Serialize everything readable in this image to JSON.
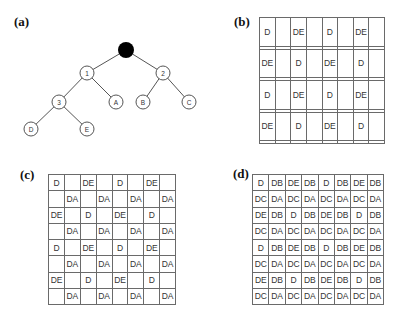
{
  "panels": {
    "a": {
      "label": "(a)",
      "tree": {
        "root": {
          "id": "root",
          "label": "",
          "filled": true,
          "x": 126,
          "y": 50,
          "r": 8
        },
        "nodes": [
          {
            "id": "n1",
            "label": "1",
            "x": 87,
            "y": 73
          },
          {
            "id": "n2",
            "label": "2",
            "x": 163,
            "y": 73
          },
          {
            "id": "n3",
            "label": "3",
            "x": 59,
            "y": 102
          },
          {
            "id": "nA",
            "label": "A",
            "x": 116,
            "y": 102
          },
          {
            "id": "nB",
            "label": "B",
            "x": 143,
            "y": 102
          },
          {
            "id": "nC",
            "label": "C",
            "x": 189,
            "y": 102
          },
          {
            "id": "nD",
            "label": "D",
            "x": 31,
            "y": 129
          },
          {
            "id": "nE",
            "label": "E",
            "x": 87,
            "y": 129
          }
        ],
        "edges": [
          [
            "root",
            "n1"
          ],
          [
            "root",
            "n2"
          ],
          [
            "n1",
            "n3"
          ],
          [
            "n1",
            "nA"
          ],
          [
            "n2",
            "nB"
          ],
          [
            "n2",
            "nC"
          ],
          [
            "n3",
            "nD"
          ],
          [
            "n3",
            "nE"
          ]
        ]
      }
    },
    "b": {
      "label": "(b)",
      "rows": [
        [
          "D",
          "",
          "DE",
          "",
          "D",
          "",
          "DE",
          ""
        ],
        [
          "",
          "",
          "",
          "",
          "",
          "",
          "",
          ""
        ],
        [
          "DE",
          "",
          "D",
          "",
          "DE",
          "",
          "D",
          ""
        ],
        [
          "",
          "",
          "",
          "",
          "",
          "",
          "",
          ""
        ],
        [
          "D",
          "",
          "DE",
          "",
          "D",
          "",
          "DE",
          ""
        ],
        [
          "",
          "",
          "",
          "",
          "",
          "",
          "",
          ""
        ],
        [
          "DE",
          "",
          "D",
          "",
          "DE",
          "",
          "D",
          ""
        ],
        [
          "",
          "",
          "",
          "",
          "",
          "",
          "",
          ""
        ]
      ]
    },
    "c": {
      "label": "(c)",
      "rows": [
        [
          "D",
          "",
          "DE",
          "",
          "D",
          "",
          "DE",
          ""
        ],
        [
          "",
          "DA",
          "",
          "DA",
          "",
          "DA",
          "",
          "DA"
        ],
        [
          "DE",
          "",
          "D",
          "",
          "DE",
          "",
          "D",
          ""
        ],
        [
          "",
          "DA",
          "",
          "DA",
          "",
          "DA",
          "",
          "DA"
        ],
        [
          "D",
          "",
          "DE",
          "",
          "D",
          "",
          "DE",
          ""
        ],
        [
          "",
          "DA",
          "",
          "DA",
          "",
          "DA",
          "",
          "DA"
        ],
        [
          "DE",
          "",
          "D",
          "",
          "DE",
          "",
          "D",
          ""
        ],
        [
          "",
          "DA",
          "",
          "DA",
          "",
          "DA",
          "",
          "DA"
        ]
      ]
    },
    "d": {
      "label": "(d)",
      "rows": [
        [
          "D",
          "DB",
          "DE",
          "DB",
          "D",
          "DB",
          "DE",
          "DB"
        ],
        [
          "DC",
          "DA",
          "DC",
          "DA",
          "DC",
          "DA",
          "DC",
          "DA"
        ],
        [
          "DE",
          "DB",
          "D",
          "DB",
          "DE",
          "DB",
          "D",
          "DB"
        ],
        [
          "DC",
          "DA",
          "DC",
          "DA",
          "DC",
          "DA",
          "DC",
          "DA"
        ],
        [
          "D",
          "DB",
          "DE",
          "DB",
          "D",
          "DB",
          "DE",
          "DB"
        ],
        [
          "DC",
          "DA",
          "DC",
          "DA",
          "DC",
          "DA",
          "DC",
          "DA"
        ],
        [
          "DE",
          "DB",
          "D",
          "DB",
          "DE",
          "DB",
          "D",
          "DB"
        ],
        [
          "DC",
          "DA",
          "DC",
          "DA",
          "DC",
          "DA",
          "DC",
          "DA"
        ]
      ]
    }
  },
  "colors": {
    "node_fill": "#ffffff",
    "root_fill": "#000000",
    "stroke": "#555555",
    "grid_border": "#6a6a6a",
    "text": "#333333"
  }
}
